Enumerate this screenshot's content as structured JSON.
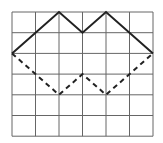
{
  "diagram": {
    "grid": {
      "cols": 6,
      "rows": 6,
      "x0": 12,
      "y0": 12,
      "cell_w": 23.5,
      "cell_h": 20.7,
      "line_color": "#666666"
    },
    "solid_path": {
      "points": [
        [
          0,
          2
        ],
        [
          2,
          0
        ],
        [
          3,
          1
        ],
        [
          4,
          0
        ],
        [
          6,
          2
        ]
      ],
      "color": "#222222"
    },
    "dashed_path": {
      "points": [
        [
          0,
          2
        ],
        [
          2,
          4
        ],
        [
          3,
          3
        ],
        [
          4,
          4
        ],
        [
          6,
          2
        ]
      ],
      "color": "#222222"
    }
  }
}
